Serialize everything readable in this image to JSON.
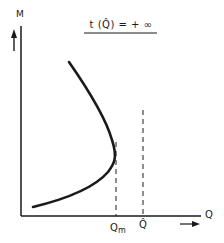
{
  "diagram": {
    "title": "t (Q̂) = + ∞",
    "y_axis_label": "M",
    "x_axis_label": "Q",
    "markers": [
      {
        "label_main": "Q",
        "label_sub": "m",
        "style": "dashed"
      },
      {
        "label": "Q̂",
        "style": "dashed"
      }
    ],
    "curve_description": "C-shaped curve opening left; M rises from lower-left, turns at maximum Q = Qm, and continues upward-left",
    "colors": {
      "ink": "#1a1a1a",
      "background": "#ffffff"
    }
  }
}
